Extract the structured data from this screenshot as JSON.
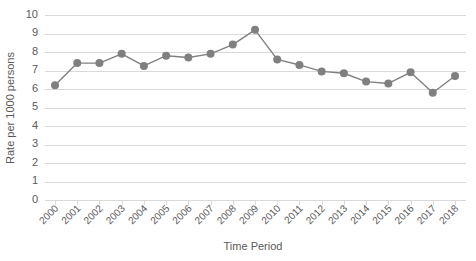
{
  "chart_data": {
    "type": "line",
    "title": "",
    "xlabel": "Time Period",
    "ylabel": "Rate per 1000 persons",
    "categories": [
      "2000",
      "2001",
      "2002",
      "2003",
      "2004",
      "2005",
      "2006",
      "2007",
      "2008",
      "2009",
      "2010",
      "2011",
      "2012",
      "2013",
      "2014",
      "2015",
      "2016",
      "2017",
      "2018"
    ],
    "values": [
      6.2,
      7.4,
      7.4,
      7.9,
      7.25,
      7.8,
      7.7,
      7.9,
      8.4,
      9.2,
      7.6,
      7.3,
      6.95,
      6.85,
      6.4,
      6.3,
      6.9,
      5.8,
      6.7
    ],
    "series": [
      {
        "name": "Rate per 1000 persons",
        "values": [
          6.2,
          7.4,
          7.4,
          7.9,
          7.25,
          7.8,
          7.7,
          7.9,
          8.4,
          9.2,
          7.6,
          7.3,
          6.95,
          6.85,
          6.4,
          6.3,
          6.9,
          5.8,
          6.7
        ]
      }
    ],
    "ylim": [
      0,
      10
    ],
    "yticks": [
      0,
      1,
      2,
      3,
      4,
      5,
      6,
      7,
      8,
      9,
      10
    ],
    "ytick_labels": [
      "0",
      "1",
      "2",
      "3",
      "4",
      "5",
      "6",
      "7",
      "8",
      "9",
      "10"
    ],
    "grid": true,
    "grid_axis": "y",
    "legend": false,
    "legend_position": "none",
    "marker": "circle",
    "colors": {
      "series": "#808080",
      "grid": "#d9d9d9",
      "axis": "#d9d9d9",
      "text": "#595959",
      "background": "#ffffff"
    },
    "xtick_rotation": -45
  }
}
